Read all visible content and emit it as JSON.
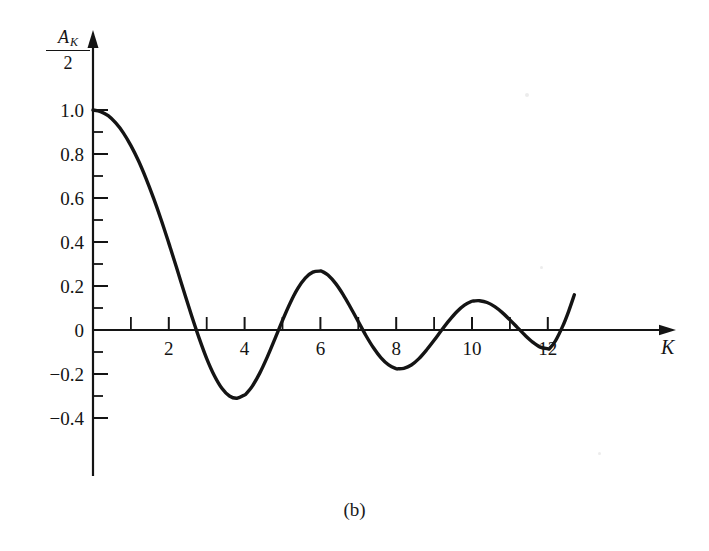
{
  "figure": {
    "caption": "(b)",
    "background": "#ffffff",
    "ink_color": "#141414"
  },
  "chart_data": {
    "type": "line",
    "title": "",
    "subtitle": "",
    "xlabel": "K",
    "ylabel": "A_K/2",
    "ylabel_parts": {
      "numerator": "A",
      "numerator_subscript": "K",
      "denominator": "2"
    },
    "xlim": [
      0,
      13.2
    ],
    "ylim": [
      -0.45,
      1.08
    ],
    "grid": false,
    "legend": null,
    "x_ticks_major": [
      2,
      4,
      6,
      8,
      10,
      12
    ],
    "x_ticks_minor": [
      1,
      3,
      5,
      7,
      9,
      11
    ],
    "x_tick_labels": [
      "2",
      "4",
      "6",
      "8",
      "10",
      "12"
    ],
    "y_ticks_major": [
      1.0,
      0.8,
      0.6,
      0.4,
      0.2,
      0,
      -0.2,
      -0.4
    ],
    "y_tick_labels": [
      "1.0",
      "0.8",
      "0.6",
      "0.4",
      "0.2",
      "0",
      "−0.2",
      "−0.4"
    ],
    "y_ticks_minor": [
      0.9,
      0.7,
      0.5,
      0.3,
      0.1,
      -0.1,
      -0.3
    ],
    "series": [
      {
        "name": "A_K/2",
        "color": "#141414",
        "x": [
          0,
          0.2,
          0.4,
          0.6,
          0.8,
          1.0,
          1.2,
          1.4,
          1.6,
          1.8,
          2.0,
          2.05,
          2.2,
          2.4,
          2.6,
          2.8,
          3.0,
          3.2,
          3.4,
          3.6,
          3.8,
          4.0,
          4.05,
          4.2,
          4.4,
          4.6,
          4.8,
          5.0,
          5.2,
          5.4,
          5.6,
          5.8,
          6.0,
          6.05,
          6.2,
          6.4,
          6.6,
          6.8,
          7.0,
          7.2,
          7.4,
          7.6,
          7.8,
          8.0,
          8.05,
          8.2,
          8.4,
          8.6,
          8.8,
          9.0,
          9.2,
          9.4,
          9.6,
          9.8,
          10.0,
          10.05,
          10.2,
          10.4,
          10.6,
          10.8,
          11.0,
          11.2,
          11.4,
          11.6,
          11.8,
          12.0,
          12.05,
          12.2,
          12.4,
          12.55,
          12.7
        ],
        "y": [
          1.0,
          0.993,
          0.974,
          0.941,
          0.896,
          0.838,
          0.769,
          0.688,
          0.598,
          0.5,
          0.395,
          0.368,
          0.286,
          0.175,
          0.066,
          -0.037,
          -0.13,
          -0.207,
          -0.265,
          -0.3,
          -0.31,
          -0.295,
          -0.288,
          -0.256,
          -0.196,
          -0.122,
          -0.04,
          0.044,
          0.122,
          0.188,
          0.236,
          0.263,
          0.268,
          0.266,
          0.25,
          0.212,
          0.161,
          0.101,
          0.038,
          -0.025,
          -0.081,
          -0.127,
          -0.159,
          -0.176,
          -0.176,
          -0.174,
          -0.159,
          -0.13,
          -0.091,
          -0.047,
          0.0,
          0.044,
          0.083,
          0.113,
          0.131,
          0.132,
          0.133,
          0.125,
          0.106,
          0.079,
          0.046,
          0.011,
          -0.024,
          -0.055,
          -0.078,
          -0.085,
          -0.083,
          -0.05,
          0.02,
          0.085,
          0.16
        ],
        "key_points": {
          "start": {
            "x": 0,
            "y": 1.0
          },
          "zeros": [
            2.05,
            4.05,
            6.05,
            8.05,
            10.0,
            12.0
          ],
          "minimum_1": {
            "x": 3.0,
            "y": -0.21
          },
          "maximum_2": {
            "x": 5.0,
            "y": 0.15
          },
          "minimum_2": {
            "x": 7.0,
            "y": -0.09
          },
          "maximum_3": {
            "x": 9.0,
            "y": 0.07
          },
          "minimum_3": {
            "x": 11.0,
            "y": -0.055
          },
          "end": {
            "x": 12.7,
            "y": 0.08
          }
        }
      }
    ],
    "axes_style": {
      "x_axis_arrow": true,
      "y_axis_arrow": true,
      "x_axis_y_value": 0,
      "y_axis_x_value": 0,
      "tick_direction": "inward"
    }
  }
}
